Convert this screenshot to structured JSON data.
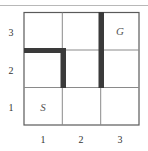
{
  "grid": {
    "rows": 3,
    "cols": 3,
    "origin_x": 24,
    "origin_y": 12,
    "cell_size": 38.33,
    "line_color": "#6b6b6b",
    "wall_color": "#3a3a3a"
  },
  "axes": {
    "x_ticks": [
      "1",
      "2",
      "3"
    ],
    "y_ticks": [
      "3",
      "2",
      "1"
    ]
  },
  "cells": {
    "start": {
      "label": "S",
      "col": 1,
      "row": 1
    },
    "goal": {
      "label": "G",
      "col": 3,
      "row": 3
    }
  },
  "walls": [
    {
      "orientation": "horizontal",
      "description": "top edge of cell (1,2)"
    },
    {
      "orientation": "vertical",
      "description": "between cells (1,2) and (2,2)"
    },
    {
      "orientation": "vertical",
      "description": "between columns 2 and 3 spanning rows 2 and 3"
    }
  ]
}
